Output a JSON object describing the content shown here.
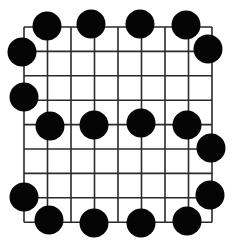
{
  "game": {
    "type": "grid-board",
    "grid": {
      "columns": 9,
      "rows": 9,
      "x_lines": [
        24,
        47.5,
        71,
        94.5,
        118,
        141.5,
        165,
        188.5,
        212
      ],
      "y_lines": [
        27,
        51.4,
        75.8,
        100.2,
        124.6,
        149,
        173.4,
        197.8,
        222.2
      ],
      "line_color": "#2a2a2a",
      "background": "#ffffff"
    },
    "stone_color": "#050505",
    "stone_radius": 14.5,
    "stones": [
      {
        "col": 1,
        "row": 0,
        "x": 47,
        "y": 26,
        "color": "black"
      },
      {
        "col": 3,
        "row": 0,
        "x": 91,
        "y": 24,
        "color": "black"
      },
      {
        "col": 5,
        "row": 0,
        "x": 140,
        "y": 24,
        "color": "black"
      },
      {
        "col": 7,
        "row": 0,
        "x": 186,
        "y": 25,
        "color": "black"
      },
      {
        "col": 0,
        "row": 1,
        "x": 22,
        "y": 52,
        "color": "black"
      },
      {
        "col": 8,
        "row": 1,
        "x": 208,
        "y": 49,
        "color": "black"
      },
      {
        "col": 0,
        "row": 3,
        "x": 24,
        "y": 97,
        "color": "black"
      },
      {
        "col": 1,
        "row": 4,
        "x": 50,
        "y": 126,
        "color": "black"
      },
      {
        "col": 3,
        "row": 4,
        "x": 94,
        "y": 125,
        "color": "black"
      },
      {
        "col": 5,
        "row": 4,
        "x": 141,
        "y": 123,
        "color": "black"
      },
      {
        "col": 7,
        "row": 4,
        "x": 187,
        "y": 125,
        "color": "black"
      },
      {
        "col": 8,
        "row": 5,
        "x": 211,
        "y": 148,
        "color": "black"
      },
      {
        "col": 0,
        "row": 7,
        "x": 24,
        "y": 197,
        "color": "black"
      },
      {
        "col": 8,
        "row": 7,
        "x": 210,
        "y": 195,
        "color": "black"
      },
      {
        "col": 1,
        "row": 8,
        "x": 49,
        "y": 220,
        "color": "black"
      },
      {
        "col": 3,
        "row": 8,
        "x": 94,
        "y": 223,
        "color": "black"
      },
      {
        "col": 5,
        "row": 8,
        "x": 141,
        "y": 223,
        "color": "black"
      },
      {
        "col": 7,
        "row": 8,
        "x": 187,
        "y": 221,
        "color": "black"
      }
    ]
  }
}
